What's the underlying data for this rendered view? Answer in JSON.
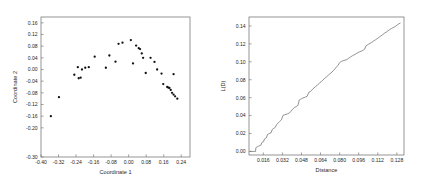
{
  "chart_data": [
    {
      "type": "scatter",
      "panel": "left",
      "title": "",
      "xlabel": "Coordinate 1",
      "ylabel": "Coordinate 2",
      "xlim": [
        -0.4,
        0.28
      ],
      "ylim": [
        -0.3,
        0.18
      ],
      "xticks": [
        -0.4,
        -0.32,
        -0.24,
        -0.16,
        -0.08,
        0.0,
        0.08,
        0.16,
        0.24
      ],
      "xticklabels": [
        "-0.40",
        "-0.32",
        "-0.24",
        "-0.16",
        "-0.08",
        "0.00",
        "0.08",
        "0.16",
        "0.24"
      ],
      "yticks": [
        -0.3,
        -0.2,
        -0.16,
        -0.12,
        -0.08,
        -0.04,
        0.0,
        0.04,
        0.08,
        0.12,
        0.16
      ],
      "yticklabels": [
        "-0.30",
        "-0.20",
        "-0.16",
        "-0.12",
        "-0.08",
        "-0.04",
        "0.00",
        "0.04",
        "0.08",
        "0.12",
        "0.16"
      ],
      "grid": false,
      "legend": "none",
      "marker": "filled-circle",
      "marker_color": "#111111",
      "points": [
        [
          -0.355,
          -0.16
        ],
        [
          -0.318,
          -0.095
        ],
        [
          -0.248,
          -0.018
        ],
        [
          -0.232,
          0.008
        ],
        [
          -0.228,
          -0.03
        ],
        [
          -0.219,
          -0.028
        ],
        [
          -0.213,
          0.0
        ],
        [
          -0.198,
          0.006
        ],
        [
          -0.182,
          0.008
        ],
        [
          -0.155,
          0.044
        ],
        [
          -0.104,
          0.006
        ],
        [
          -0.088,
          0.048
        ],
        [
          -0.06,
          0.027
        ],
        [
          -0.046,
          0.088
        ],
        [
          -0.028,
          0.092
        ],
        [
          0.01,
          0.101
        ],
        [
          0.02,
          0.021
        ],
        [
          0.034,
          0.082
        ],
        [
          0.046,
          0.073
        ],
        [
          0.052,
          0.07
        ],
        [
          0.06,
          0.055
        ],
        [
          0.066,
          0.04
        ],
        [
          0.078,
          -0.012
        ],
        [
          0.1,
          0.04
        ],
        [
          0.118,
          0.026
        ],
        [
          0.13,
          0.0
        ],
        [
          0.15,
          -0.014
        ],
        [
          0.158,
          -0.05
        ],
        [
          0.176,
          -0.06
        ],
        [
          0.181,
          -0.062
        ],
        [
          0.186,
          -0.063
        ],
        [
          0.192,
          -0.07
        ],
        [
          0.198,
          -0.08
        ],
        [
          0.205,
          -0.086
        ],
        [
          0.212,
          -0.092
        ],
        [
          0.222,
          -0.1
        ],
        [
          0.205,
          -0.016
        ]
      ]
    },
    {
      "type": "line",
      "panel": "right",
      "title": "",
      "xlabel": "Distance",
      "ylabel": "L(D)",
      "xlim": [
        0.004,
        0.134
      ],
      "ylim": [
        -0.004,
        0.15
      ],
      "xticks": [
        0.016,
        0.032,
        0.048,
        0.064,
        0.08,
        0.096,
        0.112,
        0.128
      ],
      "xticklabels": [
        "0.016",
        "0.032",
        "0.048",
        "0.064",
        "0.080",
        "0.096",
        "0.112",
        "0.128"
      ],
      "yticks": [
        0.0,
        0.02,
        0.04,
        0.06,
        0.08,
        0.1,
        0.12,
        0.14
      ],
      "yticklabels": [
        "0.00",
        "0.02",
        "0.04",
        "0.06",
        "0.08",
        "0.10",
        "0.12",
        "0.14"
      ],
      "grid": false,
      "legend": "none",
      "line_color": "#6e6e6e",
      "x": [
        0.005,
        0.008,
        0.0095,
        0.0098,
        0.0105,
        0.011,
        0.0118,
        0.0125,
        0.0132,
        0.014,
        0.0148,
        0.0155,
        0.0162,
        0.017,
        0.0178,
        0.0186,
        0.0195,
        0.0205,
        0.0215,
        0.0225,
        0.0235,
        0.0248,
        0.026,
        0.0272,
        0.0285,
        0.0298,
        0.0312,
        0.0325,
        0.0338,
        0.0352,
        0.0365,
        0.0378,
        0.0392,
        0.0405,
        0.042,
        0.0435,
        0.045,
        0.0462,
        0.0472,
        0.048,
        0.049,
        0.0502,
        0.0515,
        0.0528,
        0.0542,
        0.0556,
        0.057,
        0.0585,
        0.06,
        0.0615,
        0.063,
        0.0645,
        0.066,
        0.0675,
        0.069,
        0.0705,
        0.072,
        0.0735,
        0.0748,
        0.076,
        0.0772,
        0.0785,
        0.08,
        0.0815,
        0.083,
        0.0845,
        0.086,
        0.0876,
        0.0892,
        0.0908,
        0.0922,
        0.0938,
        0.0952,
        0.0966,
        0.098,
        0.0995,
        0.101,
        0.1022,
        0.1032,
        0.1042,
        0.1055,
        0.107,
        0.1085,
        0.11,
        0.1115,
        0.113,
        0.1145,
        0.116,
        0.1175,
        0.119,
        0.1205,
        0.122,
        0.1235,
        0.125,
        0.1265,
        0.128,
        0.1295,
        0.1308
      ],
      "y": [
        0.0,
        0.0,
        0.0,
        0.0042,
        0.0048,
        0.0052,
        0.0058,
        0.0062,
        0.0066,
        0.007,
        0.01,
        0.0104,
        0.0108,
        0.014,
        0.0146,
        0.0152,
        0.019,
        0.0196,
        0.0202,
        0.0208,
        0.0245,
        0.0258,
        0.0268,
        0.03,
        0.0318,
        0.0335,
        0.0352,
        0.0402,
        0.0408,
        0.0414,
        0.042,
        0.0428,
        0.0448,
        0.047,
        0.0488,
        0.05,
        0.0512,
        0.0575,
        0.0582,
        0.0588,
        0.0595,
        0.06,
        0.0608,
        0.0616,
        0.066,
        0.0668,
        0.069,
        0.0708,
        0.0725,
        0.0742,
        0.076,
        0.0778,
        0.0798,
        0.0815,
        0.0832,
        0.085,
        0.0868,
        0.0885,
        0.0902,
        0.092,
        0.094,
        0.0958,
        0.099,
        0.1005,
        0.1012,
        0.1018,
        0.1024,
        0.104,
        0.1055,
        0.1068,
        0.1078,
        0.109,
        0.1102,
        0.111,
        0.1118,
        0.1128,
        0.1142,
        0.118,
        0.1188,
        0.1196,
        0.1205,
        0.1218,
        0.1232,
        0.1245,
        0.1258,
        0.1272,
        0.1288,
        0.1302,
        0.1318,
        0.133,
        0.1345,
        0.136,
        0.1372,
        0.1382,
        0.1392,
        0.1408,
        0.1422,
        0.1432
      ]
    }
  ]
}
